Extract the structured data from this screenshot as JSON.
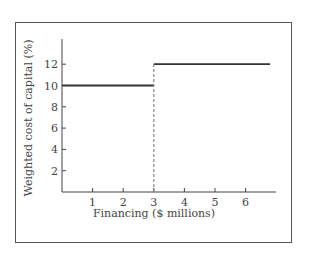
{
  "chart_data": {
    "type": "line",
    "title": "",
    "xlabel": "Financing ($ millions)",
    "ylabel": "Weighted cost of capital (%)",
    "x_ticks": [
      "1",
      "2",
      "3",
      "4",
      "5",
      "6"
    ],
    "y_ticks": [
      "2",
      "4",
      "6",
      "8",
      "10",
      "12"
    ],
    "xlim": [
      0,
      7
    ],
    "ylim": [
      0,
      14
    ],
    "grid": false,
    "series": [
      {
        "name": "Weighted cost of capital",
        "style": "solid",
        "points": [
          [
            0,
            10
          ],
          [
            3,
            10
          ]
        ]
      },
      {
        "name": "Weighted cost of capital",
        "style": "solid",
        "points": [
          [
            3,
            12
          ],
          [
            6.8,
            12
          ]
        ]
      },
      {
        "name": "Break point",
        "style": "dashed",
        "points": [
          [
            3,
            0
          ],
          [
            3,
            12
          ]
        ]
      }
    ],
    "colors": {
      "line": "#333333",
      "dashed": "#888888",
      "axis": "#444444",
      "frame": "#555555"
    }
  }
}
